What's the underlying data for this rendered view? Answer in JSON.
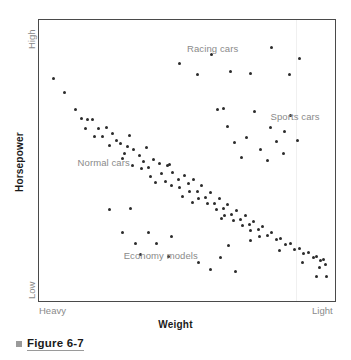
{
  "axes": {
    "y_title": "Horsepower",
    "y_high_label": "High",
    "y_low_label": "Low",
    "x_title": "Weight",
    "x_left_label": "Heavy",
    "x_right_label": "Light"
  },
  "caption": {
    "bullet_icon": "square-bullet-icon",
    "text": "Figure 6-7"
  },
  "annotations": {
    "racing": "Racing cars",
    "sports": "Sports cars",
    "normal": "Normal cars",
    "economy": "Economy models"
  },
  "colors": {
    "point": "#2b2b2b",
    "frame": "#4a4a4a",
    "annotation": "#8a8a8a",
    "axis_title": "#1a1a1a",
    "caption_bullet": "#9a9a9a",
    "background": "#ffffff"
  },
  "chart_data": {
    "type": "scatter",
    "title": "Figure 6-7",
    "xlabel": "Weight",
    "ylabel": "Horsepower",
    "xlim": [
      0,
      100
    ],
    "ylim": [
      0,
      100
    ],
    "grid": false,
    "legend": "in-plot annotations",
    "x_axis_ticks": [
      "Heavy",
      "Light"
    ],
    "y_axis_ticks": [
      "Low",
      "High"
    ],
    "series": [
      {
        "name": "Normal cars",
        "label_position": {
          "x": 12,
          "y": 49
        },
        "points": [
          [
            3.7,
            80.0
          ],
          [
            7.4,
            74.9
          ],
          [
            11.4,
            68.6
          ],
          [
            13.4,
            65.5
          ],
          [
            15.4,
            64.9
          ],
          [
            17.1,
            65.0
          ],
          [
            14.8,
            61.9
          ],
          [
            19.1,
            61.9
          ],
          [
            17.8,
            58.7
          ],
          [
            20.5,
            58.8
          ],
          [
            22.1,
            62.0
          ],
          [
            24.2,
            59.9
          ],
          [
            25.5,
            57.4
          ],
          [
            26.9,
            56.3
          ],
          [
            29.5,
            55.0
          ],
          [
            28.2,
            52.4
          ],
          [
            31.5,
            53.9
          ],
          [
            33.6,
            52.0
          ],
          [
            35.0,
            49.6
          ],
          [
            31.2,
            48.3
          ],
          [
            34.2,
            47.0
          ],
          [
            36.6,
            47.5
          ],
          [
            38.3,
            50.2
          ],
          [
            40.3,
            49.0
          ],
          [
            37.2,
            44.3
          ],
          [
            41.0,
            45.4
          ],
          [
            43.3,
            48.0
          ],
          [
            45.0,
            45.6
          ],
          [
            42.4,
            42.3
          ],
          [
            44.6,
            41.0
          ],
          [
            46.9,
            43.2
          ],
          [
            49.1,
            44.5
          ],
          [
            47.5,
            40.2
          ],
          [
            50.6,
            41.4
          ],
          [
            52.3,
            43.0
          ],
          [
            51.0,
            38.5
          ],
          [
            53.6,
            38.8
          ],
          [
            55.2,
            40.8
          ],
          [
            54.0,
            36.2
          ],
          [
            56.4,
            36.5
          ],
          [
            58.1,
            38.4
          ],
          [
            57.0,
            34.2
          ],
          [
            59.5,
            34.4
          ],
          [
            61.2,
            36.0
          ],
          [
            60.1,
            32.0
          ],
          [
            62.5,
            32.4
          ],
          [
            64.1,
            33.8
          ],
          [
            63.0,
            30.0
          ],
          [
            65.5,
            30.2
          ],
          [
            67.1,
            31.6
          ],
          [
            66.0,
            28.0
          ],
          [
            68.6,
            28.4
          ],
          [
            70.2,
            29.8
          ],
          [
            69.1,
            26.2
          ],
          [
            71.6,
            26.6
          ],
          [
            73.2,
            27.8
          ],
          [
            72.1,
            24.2
          ],
          [
            74.7,
            24.6
          ],
          [
            76.3,
            25.8
          ],
          [
            75.2,
            22.3
          ],
          [
            77.8,
            22.6
          ],
          [
            79.4,
            23.8
          ],
          [
            81.0,
            21.0
          ],
          [
            82.6,
            21.4
          ],
          [
            84.2,
            19.2
          ],
          [
            85.8,
            19.6
          ],
          [
            87.4,
            17.4
          ],
          [
            89.0,
            17.8
          ],
          [
            90.6,
            16.0
          ],
          [
            92.2,
            16.4
          ],
          [
            93.8,
            14.6
          ],
          [
            95.0,
            15.0
          ],
          [
            96.2,
            13.2
          ],
          [
            97.4,
            13.6
          ],
          [
            98.2,
            11.8
          ],
          [
            23.0,
            55.5
          ],
          [
            27.5,
            50.8
          ],
          [
            39.0,
            41.8
          ],
          [
            48.5,
            36.8
          ],
          [
            30.0,
            59.2
          ],
          [
            36.0,
            54.6
          ],
          [
            44.0,
            48.6
          ],
          [
            52.0,
            34.6
          ],
          [
            62.0,
            28.6
          ],
          [
            72.0,
            20.6
          ],
          [
            82.0,
            17.0
          ],
          [
            90.0,
            12.6
          ],
          [
            96.0,
            10.8
          ]
        ]
      },
      {
        "name": "Racing cars",
        "label_position": {
          "x": 50,
          "y": 91
        },
        "points": [
          [
            47.5,
            85.5
          ],
          [
            58.5,
            89.0
          ],
          [
            65.0,
            82.5
          ],
          [
            79.5,
            91.5
          ],
          [
            89.0,
            87.5
          ],
          [
            53.5,
            81.5
          ],
          [
            72.0,
            82.0
          ],
          [
            85.5,
            81.5
          ]
        ]
      },
      {
        "name": "Sports cars",
        "label_position": {
          "x": 79,
          "y": 66
        },
        "points": [
          [
            60.5,
            68.5
          ],
          [
            73.5,
            68.0
          ],
          [
            86.0,
            66.5
          ],
          [
            64.0,
            62.5
          ],
          [
            79.0,
            62.0
          ],
          [
            66.5,
            56.5
          ],
          [
            81.0,
            57.0
          ],
          [
            88.5,
            57.5
          ],
          [
            70.5,
            58.5
          ],
          [
            75.5,
            54.0
          ],
          [
            83.5,
            52.5
          ],
          [
            78.0,
            50.0
          ],
          [
            69.0,
            51.0
          ],
          [
            62.5,
            69.0
          ],
          [
            84.0,
            60.5
          ]
        ]
      },
      {
        "name": "Economy models",
        "label_position": {
          "x": 28,
          "y": 15
        },
        "points": [
          [
            23.0,
            32.0
          ],
          [
            30.5,
            32.5
          ],
          [
            27.5,
            23.5
          ],
          [
            36.5,
            23.5
          ],
          [
            32.0,
            19.5
          ],
          [
            39.5,
            19.5
          ],
          [
            44.5,
            22.0
          ],
          [
            34.0,
            15.5
          ],
          [
            43.5,
            15.0
          ],
          [
            54.0,
            12.5
          ],
          [
            61.5,
            14.5
          ],
          [
            58.0,
            10.0
          ],
          [
            67.0,
            9.5
          ],
          [
            64.5,
            19.0
          ],
          [
            95.0,
            7.5
          ],
          [
            98.5,
            7.5
          ]
        ]
      }
    ]
  }
}
